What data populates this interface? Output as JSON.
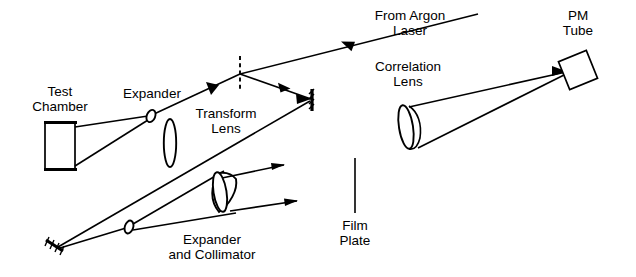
{
  "figure": {
    "background_color": "#ffffff",
    "line_color": "#000000",
    "width": 636,
    "height": 277
  },
  "labels": {
    "from_argon_laser": "From Argon\nLaser",
    "pm_tube": "PM\nTube",
    "correlation_lens": "Correlation\nLens",
    "test_chamber": "Test\nChamber",
    "expander_top": "Expander",
    "transform_lens": "Transform\nLens",
    "film_plate": "Film\nPlate",
    "expander_and_collimator": "Expander\nand Collimator"
  },
  "components": [
    {
      "name": "test-chamber",
      "label": "Test Chamber",
      "shape": "rectangle"
    },
    {
      "name": "expander-top",
      "label": "Expander",
      "shape": "small-lens"
    },
    {
      "name": "transform-lens",
      "label": "Transform Lens",
      "shape": "vertical-lens"
    },
    {
      "name": "beam-splitter",
      "label": "",
      "shape": "dashed-line"
    },
    {
      "name": "mirror-right",
      "label": "",
      "shape": "hatched-mirror"
    },
    {
      "name": "mirror-lower-left",
      "label": "",
      "shape": "hatched-mirror"
    },
    {
      "name": "expander-collimator-small-lens",
      "label": "Expander and Collimator",
      "shape": "small-lens"
    },
    {
      "name": "collimator-lens",
      "label": "Expander and Collimator",
      "shape": "tilted-lens"
    },
    {
      "name": "film-plate",
      "label": "Film Plate",
      "shape": "vertical-line"
    },
    {
      "name": "correlation-lens",
      "label": "Correlation Lens",
      "shape": "tilted-lens"
    },
    {
      "name": "pm-tube",
      "label": "PM Tube",
      "shape": "rotated-square"
    }
  ],
  "beams": [
    {
      "name": "input-beam-from-laser",
      "direction": "down-left"
    },
    {
      "name": "beam-to-expander-top",
      "direction": "down-left"
    },
    {
      "name": "beam-split-to-mirror",
      "direction": "down-right"
    },
    {
      "name": "beam-mirror-to-lower-left",
      "direction": "down-left"
    },
    {
      "name": "beam-test-chamber-upper",
      "direction": "right"
    },
    {
      "name": "beam-test-chamber-lower",
      "direction": "right"
    },
    {
      "name": "beam-collimated-upper",
      "direction": "up-right"
    },
    {
      "name": "beam-collimated-lower",
      "direction": "up-right"
    },
    {
      "name": "beam-correlation-to-pm-upper",
      "direction": "up-right"
    },
    {
      "name": "beam-correlation-to-pm-lower",
      "direction": "up-right"
    }
  ]
}
